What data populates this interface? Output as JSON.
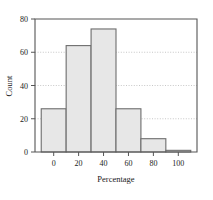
{
  "chart_data": {
    "type": "bar",
    "title": "",
    "subtitle": "",
    "xlabel": "Percentage",
    "ylabel": "Count",
    "grid": true,
    "legend": null,
    "legend_position": "none",
    "xlim": [
      -15,
      115
    ],
    "ylim": [
      0,
      80
    ],
    "xticks": [
      0,
      20,
      40,
      60,
      80,
      100
    ],
    "yticks": [
      0,
      20,
      40,
      60,
      80
    ],
    "xtick_labels": [
      "0",
      "20",
      "40",
      "60",
      "80",
      "100"
    ],
    "ytick_labels": [
      "0",
      "20",
      "40",
      "60",
      "80"
    ],
    "bin_edges": [
      -10,
      10,
      30,
      50,
      70,
      90,
      110
    ],
    "bin_width": 20,
    "categories": [
      "-10 to 10",
      "10 to 30",
      "30 to 50",
      "50 to 70",
      "70 to 90",
      "90 to 110"
    ],
    "values": [
      26,
      64,
      74,
      26,
      8,
      1
    ],
    "bar_fill": "#e7e7e7",
    "bar_stroke": "#6d6d6d",
    "grid_color": "#b9b9b9",
    "axis_color": "#555555"
  },
  "axes": {
    "x_label": "Percentage",
    "y_label": "Count"
  }
}
